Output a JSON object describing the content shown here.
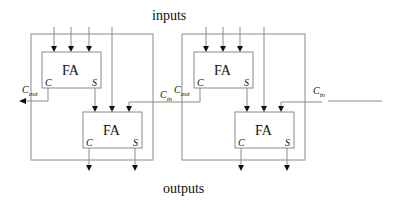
{
  "title_top": "inputs",
  "title_bottom": "outputs",
  "colors": {
    "line": "#8a8a8a",
    "arrow": "#111111",
    "text": "#111111"
  },
  "blocks": [
    {
      "id": "left",
      "upper_fa": {
        "label": "FA",
        "carry_port": "C",
        "sum_port": "S"
      },
      "lower_fa": {
        "label": "FA",
        "carry_port": "C",
        "sum_port": "S"
      },
      "cout_label": {
        "main": "C",
        "sub": "out"
      },
      "cin_label": {
        "main": "C",
        "sub": "in"
      }
    },
    {
      "id": "right",
      "upper_fa": {
        "label": "FA",
        "carry_port": "C",
        "sum_port": "S"
      },
      "lower_fa": {
        "label": "FA",
        "carry_port": "C",
        "sum_port": "S"
      },
      "cout_label": {
        "main": "C",
        "sub": "out"
      },
      "cin_label": {
        "main": "C",
        "sub": "in"
      }
    }
  ]
}
